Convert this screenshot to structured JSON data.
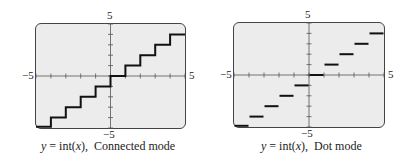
{
  "chart_data": [
    {
      "type": "line",
      "title": "y = int(x), Connected mode",
      "function": "y = int(x)",
      "mode": "Connected mode",
      "xlim": [
        -5,
        5
      ],
      "ylim": [
        -5,
        5
      ],
      "xscale": 1,
      "yscale": 1,
      "grid": false,
      "tick_labels": {
        "x_min": "-5",
        "x_max": "5",
        "y_min": "-5",
        "y_max": "5"
      },
      "x": [
        -5,
        -4,
        -4,
        -3,
        -3,
        -2,
        -2,
        -1,
        -1,
        0,
        0,
        1,
        1,
        2,
        2,
        3,
        3,
        4,
        4,
        5
      ],
      "y": [
        -5,
        -5,
        -4,
        -4,
        -3,
        -3,
        -2,
        -2,
        -1,
        -1,
        0,
        0,
        1,
        1,
        2,
        2,
        3,
        3,
        4,
        4
      ]
    },
    {
      "type": "line",
      "title": "y = int(x), Dot mode",
      "function": "y = int(x)",
      "mode": "Dot mode",
      "xlim": [
        -5,
        5
      ],
      "ylim": [
        -5,
        5
      ],
      "xscale": 1,
      "yscale": 1,
      "grid": false,
      "tick_labels": {
        "x_min": "-5",
        "x_max": "5",
        "y_min": "-5",
        "y_max": "5"
      },
      "segments": [
        {
          "x": [
            -5,
            -4
          ],
          "y": -5
        },
        {
          "x": [
            -4,
            -3
          ],
          "y": -4
        },
        {
          "x": [
            -3,
            -2
          ],
          "y": -3
        },
        {
          "x": [
            -2,
            -1
          ],
          "y": -2
        },
        {
          "x": [
            -1,
            0
          ],
          "y": -1
        },
        {
          "x": [
            0,
            1
          ],
          "y": 0
        },
        {
          "x": [
            1,
            2
          ],
          "y": 1
        },
        {
          "x": [
            2,
            3
          ],
          "y": 2
        },
        {
          "x": [
            3,
            4
          ],
          "y": 3
        },
        {
          "x": [
            4,
            5
          ],
          "y": 4
        }
      ]
    }
  ],
  "panels": [
    {
      "y_max_label": "5",
      "y_min_label": "−5",
      "x_min_label": "−5",
      "x_max_label": "5",
      "caption_lhs": "y",
      "caption_eq": " = int(",
      "caption_var": "x",
      "caption_close": "),",
      "caption_mode": "Connected mode"
    },
    {
      "y_max_label": "5",
      "y_min_label": "−5",
      "x_min_label": "−5",
      "x_max_label": "5",
      "caption_lhs": "y",
      "caption_eq": " = int(",
      "caption_var": "x",
      "caption_close": "),",
      "caption_mode": "Dot mode"
    }
  ]
}
